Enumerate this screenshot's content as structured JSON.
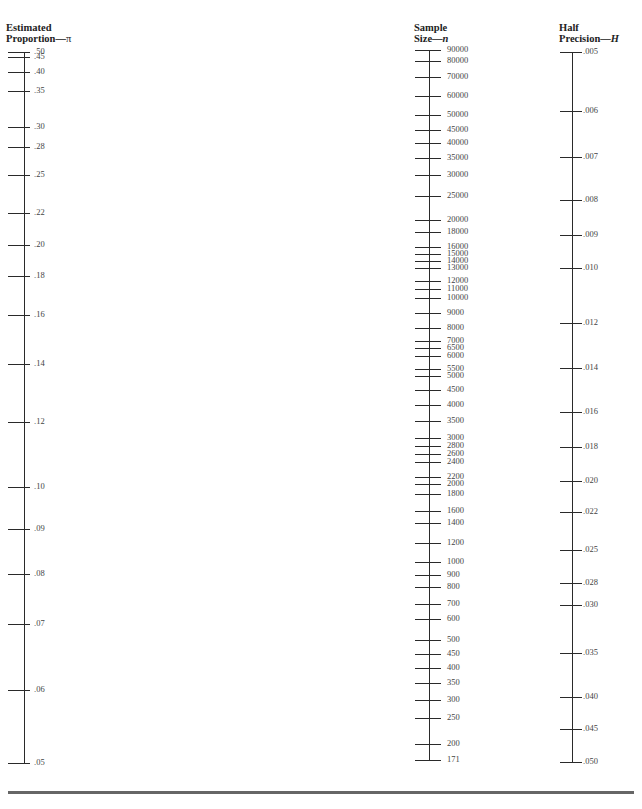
{
  "chart_data": {
    "type": "nomogram",
    "axes": [
      {
        "key": "proportion",
        "heading_line1": "Estimated",
        "heading_line2": "Proportion—",
        "symbol": "π",
        "line_x": 24,
        "line_top": 52,
        "line_bottom": 763,
        "tick_left": 8,
        "tick_len": 22,
        "label_x": 34,
        "heading_x": 6,
        "ticks": [
          {
            "label": ".50",
            "y": 52
          },
          {
            "label": ".45",
            "y": 57
          },
          {
            "label": ".40",
            "y": 72
          },
          {
            "label": ".35",
            "y": 91
          },
          {
            "label": ".30",
            "y": 127
          },
          {
            "label": ".28",
            "y": 147
          },
          {
            "label": ".25",
            "y": 175
          },
          {
            "label": ".22",
            "y": 213
          },
          {
            "label": ".20",
            "y": 245
          },
          {
            "label": ".18",
            "y": 276
          },
          {
            "label": ".16",
            "y": 315
          },
          {
            "label": ".14",
            "y": 364
          },
          {
            "label": ".12",
            "y": 422
          },
          {
            "label": ".10",
            "y": 487
          },
          {
            "label": ".09",
            "y": 529
          },
          {
            "label": ".08",
            "y": 574
          },
          {
            "label": ".07",
            "y": 624
          },
          {
            "label": ".06",
            "y": 690
          },
          {
            "label": ".05",
            "y": 763
          }
        ]
      },
      {
        "key": "sample_size",
        "heading_line1": "Sample",
        "heading_line2": "Size—",
        "symbol": "n",
        "line_x": 429,
        "line_top": 50,
        "line_bottom": 760,
        "tick_left": 415,
        "tick_len": 26,
        "label_x": 447,
        "heading_x": 414,
        "ticks": [
          {
            "label": "90000",
            "y": 50
          },
          {
            "label": "80000",
            "y": 61
          },
          {
            "label": "70000",
            "y": 77
          },
          {
            "label": "60000",
            "y": 96
          },
          {
            "label": "50000",
            "y": 115
          },
          {
            "label": "45000",
            "y": 130
          },
          {
            "label": "40000",
            "y": 143
          },
          {
            "label": "35000",
            "y": 158
          },
          {
            "label": "30000",
            "y": 175
          },
          {
            "label": "25000",
            "y": 196
          },
          {
            "label": "20000",
            "y": 220
          },
          {
            "label": "18000",
            "y": 232
          },
          {
            "label": "16000",
            "y": 247
          },
          {
            "label": "15000",
            "y": 254
          },
          {
            "label": "14000",
            "y": 261
          },
          {
            "label": "13000",
            "y": 268
          },
          {
            "label": "12000",
            "y": 281
          },
          {
            "label": "11000",
            "y": 289
          },
          {
            "label": "10000",
            "y": 298
          },
          {
            "label": "9000",
            "y": 313
          },
          {
            "label": "8000",
            "y": 328
          },
          {
            "label": "7000",
            "y": 341
          },
          {
            "label": "6500",
            "y": 348
          },
          {
            "label": "6000",
            "y": 356
          },
          {
            "label": "5500",
            "y": 369
          },
          {
            "label": "5000",
            "y": 376
          },
          {
            "label": "4500",
            "y": 390
          },
          {
            "label": "4000",
            "y": 405
          },
          {
            "label": "3500",
            "y": 421
          },
          {
            "label": "3000",
            "y": 438
          },
          {
            "label": "2800",
            "y": 446
          },
          {
            "label": "2600",
            "y": 454
          },
          {
            "label": "2400",
            "y": 462
          },
          {
            "label": "2200",
            "y": 477
          },
          {
            "label": "2000",
            "y": 484
          },
          {
            "label": "1800",
            "y": 494
          },
          {
            "label": "1600",
            "y": 511
          },
          {
            "label": "1400",
            "y": 523
          },
          {
            "label": "1200",
            "y": 543
          },
          {
            "label": "1000",
            "y": 562
          },
          {
            "label": "900",
            "y": 575
          },
          {
            "label": "800",
            "y": 587
          },
          {
            "label": "700",
            "y": 604
          },
          {
            "label": "600",
            "y": 619
          },
          {
            "label": "500",
            "y": 640
          },
          {
            "label": "450",
            "y": 654
          },
          {
            "label": "400",
            "y": 668
          },
          {
            "label": "350",
            "y": 683
          },
          {
            "label": "300",
            "y": 700
          },
          {
            "label": "250",
            "y": 718
          },
          {
            "label": "200",
            "y": 744
          },
          {
            "label": "171",
            "y": 760
          }
        ]
      },
      {
        "key": "half_precision",
        "heading_line1": "Half",
        "heading_line2": "Precision—",
        "symbol": "H",
        "line_x": 572,
        "line_top": 52,
        "line_bottom": 762,
        "tick_left": 560,
        "tick_len": 22,
        "label_x": 583,
        "heading_x": 559,
        "ticks": [
          {
            "label": ".005",
            "y": 52
          },
          {
            "label": ".006",
            "y": 111
          },
          {
            "label": ".007",
            "y": 157
          },
          {
            "label": ".008",
            "y": 200
          },
          {
            "label": ".009",
            "y": 235
          },
          {
            "label": ".010",
            "y": 268
          },
          {
            "label": ".012",
            "y": 323
          },
          {
            "label": ".014",
            "y": 368
          },
          {
            "label": ".016",
            "y": 412
          },
          {
            "label": ".018",
            "y": 447
          },
          {
            "label": ".020",
            "y": 481
          },
          {
            "label": ".022",
            "y": 512
          },
          {
            "label": ".025",
            "y": 550
          },
          {
            "label": ".028",
            "y": 583
          },
          {
            "label": ".030",
            "y": 605
          },
          {
            "label": ".035",
            "y": 653
          },
          {
            "label": ".040",
            "y": 697
          },
          {
            "label": ".045",
            "y": 729
          },
          {
            "label": ".050",
            "y": 762
          }
        ]
      }
    ]
  }
}
